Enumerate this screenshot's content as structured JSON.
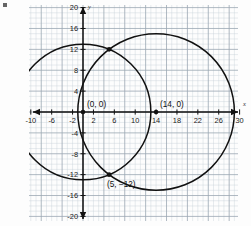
{
  "chart_data": {
    "type": "scatter",
    "title": "",
    "xlabel": "x",
    "ylabel": "y",
    "xlim": [
      -13.5,
      31.5
    ],
    "ylim": [
      -21,
      21
    ],
    "grid": true,
    "grid_minor_step": 1,
    "grid_major_step": 4,
    "legend": "none",
    "xticks": [
      -10,
      -6,
      -2,
      2,
      6,
      10,
      14,
      18,
      22,
      26,
      30
    ],
    "xtick_labels": [
      "-10",
      "-6",
      "-2",
      "2",
      "6",
      "10",
      "14",
      "18",
      "22",
      "26",
      "30"
    ],
    "yticks": [
      20,
      16,
      12,
      8,
      4,
      -4,
      -8,
      -12,
      -16,
      -20
    ],
    "ytick_labels": [
      "20",
      "16",
      "12",
      "8",
      "4",
      "-4",
      "-8",
      "-12",
      "-16",
      "-20"
    ],
    "shapes": [
      {
        "kind": "circle",
        "name": "circle-origin",
        "cx": 0,
        "cy": 0,
        "r": 13
      },
      {
        "kind": "circle",
        "name": "circle-shifted",
        "cx": 14,
        "cy": 0,
        "r": 15
      }
    ],
    "points": [
      {
        "name": "center-origin",
        "x": 0,
        "y": 0,
        "label": "(0, 0)",
        "label_dx": 4,
        "label_dy": -5
      },
      {
        "name": "center-shifted",
        "x": 14,
        "y": 0,
        "label": "(14, 0)",
        "label_dx": 4,
        "label_dy": -5
      },
      {
        "name": "intersection-lower",
        "x": 5,
        "y": -12,
        "label": "(5, −12)",
        "label_dx": -2,
        "label_dy": 12
      },
      {
        "name": "intersection-upper",
        "x": 5,
        "y": 12,
        "label": "",
        "label_dx": 0,
        "label_dy": 0
      }
    ]
  },
  "axes": {
    "x_axis_label": "x",
    "y_axis_label": "y"
  },
  "colors": {
    "grid_minor": "#c6cfd6",
    "grid_major": "#9aa7b2",
    "axis": "#111111",
    "curve": "#111111",
    "point": "#111111",
    "paper": "#fdfdfd"
  }
}
